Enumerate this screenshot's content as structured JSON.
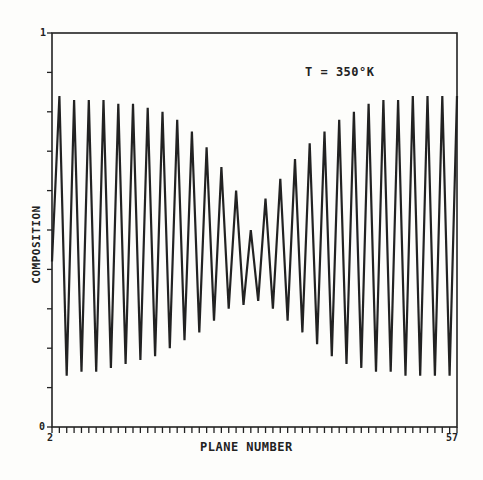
{
  "chart_data": {
    "type": "line",
    "title": "T = 350°K",
    "xlabel": "PLANE NUMBER",
    "ylabel": "COMPOSITION",
    "xlim": [
      2,
      57
    ],
    "ylim": [
      0,
      1
    ],
    "x_tick_labels": [
      "2",
      "57"
    ],
    "y_tick_labels": [
      "0",
      "1"
    ],
    "y_minor_ticks": 10,
    "x_minor_ticks": 55,
    "grid": false,
    "legend": null,
    "annotation": "T = 350°K",
    "series": [
      {
        "name": "composition",
        "x": [
          2,
          3,
          4,
          5,
          6,
          7,
          8,
          9,
          10,
          11,
          12,
          13,
          14,
          15,
          16,
          17,
          18,
          19,
          20,
          21,
          22,
          23,
          24,
          25,
          26,
          27,
          28,
          29,
          30,
          31,
          32,
          33,
          34,
          35,
          36,
          37,
          38,
          39,
          40,
          41,
          42,
          43,
          44,
          45,
          46,
          47,
          48,
          49,
          50,
          51,
          52,
          53,
          54,
          55,
          56,
          57
        ],
        "values": [
          0.42,
          0.84,
          0.13,
          0.83,
          0.14,
          0.83,
          0.14,
          0.83,
          0.15,
          0.82,
          0.16,
          0.82,
          0.17,
          0.81,
          0.18,
          0.8,
          0.2,
          0.78,
          0.22,
          0.75,
          0.24,
          0.71,
          0.27,
          0.66,
          0.3,
          0.6,
          0.31,
          0.5,
          0.32,
          0.58,
          0.3,
          0.63,
          0.27,
          0.68,
          0.24,
          0.72,
          0.21,
          0.75,
          0.18,
          0.78,
          0.16,
          0.8,
          0.15,
          0.82,
          0.14,
          0.83,
          0.14,
          0.83,
          0.13,
          0.84,
          0.13,
          0.84,
          0.13,
          0.84,
          0.13,
          0.84
        ]
      }
    ]
  },
  "labels": {
    "title": "T = 350°K",
    "xlabel": "PLANE NUMBER",
    "ylabel": "COMPOSITION",
    "ymax": "1",
    "ymin": "0",
    "xmin": "2",
    "xmax": "57"
  },
  "colors": {
    "ink": "#222222",
    "paper": "#fdfdfb"
  }
}
